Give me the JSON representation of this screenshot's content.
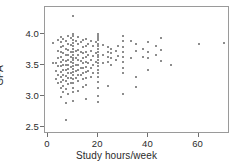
{
  "chart_data": {
    "type": "scatter",
    "title": "",
    "xlabel": "Study hours/week",
    "ylabel": "GPA",
    "xlim": [
      -1.2,
      72.5
    ],
    "ylim": [
      2.38,
      4.43
    ],
    "xticks": [
      0,
      20,
      40,
      60
    ],
    "xtick_labels": [
      "0",
      "20",
      "40",
      "60"
    ],
    "yticks": [
      2.5,
      3.0,
      3.5,
      4.0
    ],
    "ytick_labels": [
      "2.5",
      "3.0",
      "3.5",
      "4.0"
    ],
    "grid": false,
    "legend": null,
    "marker": "small-square",
    "marker_color": "#8d8d8d",
    "frame_color": "#9a9a9a",
    "background": "#ffffff",
    "n_points": 171,
    "points": [
      [
        2,
        3.85
      ],
      [
        2,
        3.53
      ],
      [
        3,
        3.52
      ],
      [
        3,
        3.4
      ],
      [
        3,
        3.26
      ],
      [
        4,
        3.9
      ],
      [
        4,
        3.72
      ],
      [
        4,
        3.6
      ],
      [
        4,
        3.48
      ],
      [
        4,
        3.33
      ],
      [
        4,
        3.21
      ],
      [
        5,
        3.95
      ],
      [
        5,
        3.86
      ],
      [
        5,
        3.78
      ],
      [
        5,
        3.7
      ],
      [
        5,
        3.62
      ],
      [
        5,
        3.55
      ],
      [
        5,
        3.47
      ],
      [
        5,
        3.38
      ],
      [
        5,
        3.3
      ],
      [
        5,
        3.22
      ],
      [
        5,
        3.12
      ],
      [
        5,
        2.97
      ],
      [
        6,
        3.92
      ],
      [
        6,
        3.8
      ],
      [
        6,
        3.68
      ],
      [
        6,
        3.58
      ],
      [
        6,
        3.5
      ],
      [
        6,
        3.42
      ],
      [
        6,
        3.34
      ],
      [
        6,
        3.25
      ],
      [
        6,
        3.16
      ],
      [
        6,
        3.05
      ],
      [
        7,
        3.88
      ],
      [
        7,
        3.76
      ],
      [
        7,
        3.66
      ],
      [
        7,
        3.56
      ],
      [
        7,
        3.49
      ],
      [
        7,
        3.41
      ],
      [
        7,
        3.32
      ],
      [
        7,
        3.23
      ],
      [
        7,
        3.1
      ],
      [
        7,
        2.88
      ],
      [
        7,
        2.6
      ],
      [
        8,
        3.97
      ],
      [
        8,
        3.84
      ],
      [
        8,
        3.74
      ],
      [
        8,
        3.65
      ],
      [
        8,
        3.57
      ],
      [
        8,
        3.5
      ],
      [
        8,
        3.43
      ],
      [
        8,
        3.36
      ],
      [
        8,
        3.28
      ],
      [
        8,
        3.18
      ],
      [
        8,
        3.02
      ],
      [
        9,
        3.93
      ],
      [
        9,
        3.82
      ],
      [
        9,
        3.71
      ],
      [
        9,
        3.63
      ],
      [
        9,
        3.55
      ],
      [
        9,
        3.46
      ],
      [
        9,
        3.37
      ],
      [
        9,
        3.29
      ],
      [
        9,
        3.2
      ],
      [
        10,
        4.29
      ],
      [
        10,
        4.0
      ],
      [
        10,
        3.96
      ],
      [
        10,
        3.9
      ],
      [
        10,
        3.85
      ],
      [
        10,
        3.8
      ],
      [
        10,
        3.75
      ],
      [
        10,
        3.7
      ],
      [
        10,
        3.66
      ],
      [
        10,
        3.61
      ],
      [
        10,
        3.57
      ],
      [
        10,
        3.52
      ],
      [
        10,
        3.48
      ],
      [
        10,
        3.43
      ],
      [
        10,
        3.38
      ],
      [
        10,
        3.33
      ],
      [
        10,
        3.27
      ],
      [
        10,
        3.2
      ],
      [
        10,
        3.13
      ],
      [
        10,
        3.05
      ],
      [
        10,
        2.92
      ],
      [
        11,
        3.88
      ],
      [
        11,
        3.72
      ],
      [
        11,
        3.6
      ],
      [
        11,
        3.5
      ],
      [
        11,
        3.4
      ],
      [
        11,
        3.28
      ],
      [
        12,
        3.95
      ],
      [
        12,
        3.83
      ],
      [
        12,
        3.74
      ],
      [
        12,
        3.66
      ],
      [
        12,
        3.58
      ],
      [
        12,
        3.5
      ],
      [
        12,
        3.42
      ],
      [
        12,
        3.34
      ],
      [
        12,
        3.24
      ],
      [
        12,
        3.08
      ],
      [
        13,
        3.86
      ],
      [
        13,
        3.7
      ],
      [
        13,
        3.56
      ],
      [
        13,
        3.45
      ],
      [
        13,
        3.33
      ],
      [
        14,
        3.9
      ],
      [
        14,
        3.78
      ],
      [
        14,
        3.68
      ],
      [
        14,
        3.6
      ],
      [
        14,
        3.52
      ],
      [
        14,
        3.44
      ],
      [
        14,
        3.36
      ],
      [
        14,
        3.26
      ],
      [
        14,
        3.14
      ],
      [
        15,
        3.92
      ],
      [
        15,
        3.8
      ],
      [
        15,
        3.7
      ],
      [
        15,
        3.62
      ],
      [
        15,
        3.54
      ],
      [
        15,
        3.46
      ],
      [
        15,
        3.38
      ],
      [
        15,
        3.28
      ],
      [
        15,
        3.17
      ],
      [
        15,
        2.95
      ],
      [
        16,
        3.84
      ],
      [
        16,
        3.66
      ],
      [
        16,
        3.52
      ],
      [
        16,
        3.4
      ],
      [
        17,
        3.88
      ],
      [
        17,
        3.72
      ],
      [
        17,
        3.58
      ],
      [
        17,
        3.44
      ],
      [
        17,
        3.3
      ],
      [
        18,
        3.8
      ],
      [
        18,
        3.64
      ],
      [
        18,
        3.5
      ],
      [
        18,
        3.36
      ],
      [
        19,
        3.86
      ],
      [
        19,
        3.68
      ],
      [
        19,
        3.54
      ],
      [
        20,
        4.0
      ],
      [
        20,
        3.97
      ],
      [
        20,
        3.93
      ],
      [
        20,
        3.89
      ],
      [
        20,
        3.84
      ],
      [
        20,
        3.8
      ],
      [
        20,
        3.75
      ],
      [
        20,
        3.71
      ],
      [
        20,
        3.66
      ],
      [
        20,
        3.62
      ],
      [
        20,
        3.57
      ],
      [
        20,
        3.52
      ],
      [
        20,
        3.47
      ],
      [
        20,
        3.42
      ],
      [
        20,
        3.36
      ],
      [
        20,
        3.3
      ],
      [
        20,
        3.22
      ],
      [
        20,
        3.12
      ],
      [
        20,
        3.0
      ],
      [
        20,
        2.9
      ],
      [
        22,
        3.82
      ],
      [
        22,
        3.66
      ],
      [
        22,
        3.52
      ],
      [
        24,
        3.78
      ],
      [
        24,
        3.7
      ],
      [
        24,
        3.62
      ],
      [
        24,
        3.55
      ],
      [
        24,
        3.16
      ],
      [
        25,
        3.75
      ],
      [
        25,
        3.68
      ],
      [
        25,
        3.6
      ],
      [
        25,
        3.5
      ],
      [
        27,
        3.72
      ],
      [
        27,
        3.58
      ],
      [
        28,
        3.8
      ],
      [
        28,
        3.64
      ],
      [
        30,
        3.97
      ],
      [
        30,
        3.88
      ],
      [
        30,
        3.78
      ],
      [
        30,
        3.7
      ],
      [
        30,
        3.62
      ],
      [
        30,
        3.54
      ],
      [
        30,
        3.45
      ],
      [
        30,
        3.36
      ],
      [
        30,
        3.03
      ],
      [
        33,
        3.88
      ],
      [
        33,
        3.6
      ],
      [
        35,
        3.84
      ],
      [
        35,
        3.72
      ],
      [
        35,
        3.3
      ],
      [
        35,
        3.14
      ],
      [
        38,
        3.76
      ],
      [
        38,
        3.62
      ],
      [
        40,
        3.86
      ],
      [
        40,
        3.7
      ],
      [
        40,
        3.6
      ],
      [
        40,
        3.42
      ],
      [
        43,
        3.8
      ],
      [
        43,
        3.66
      ],
      [
        45,
        3.93
      ],
      [
        45,
        3.74
      ],
      [
        45,
        3.56
      ],
      [
        49,
        3.5
      ],
      [
        60,
        3.83
      ],
      [
        70,
        3.85
      ]
    ]
  }
}
